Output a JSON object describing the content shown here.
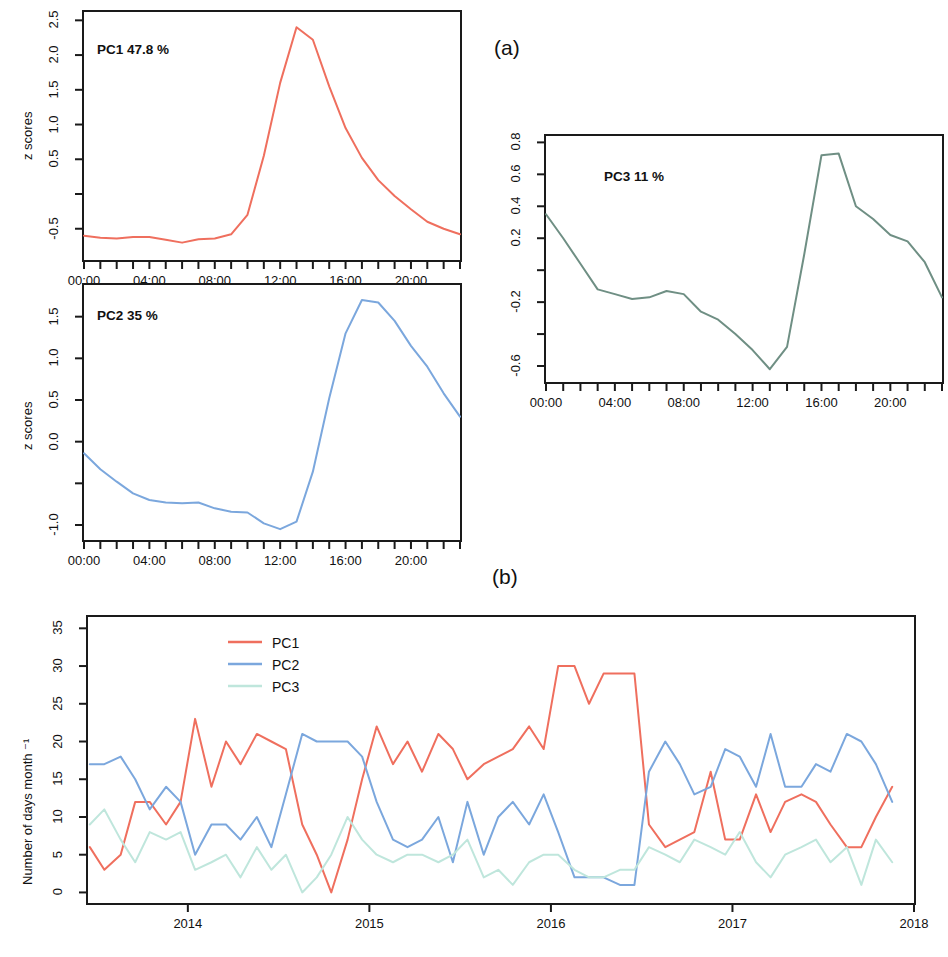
{
  "figure": {
    "panel_a_label": "(a)",
    "panel_b_label": "(b)"
  },
  "chart_data": [
    {
      "id": "pc1",
      "type": "line",
      "title": "PC1 47.8 %",
      "xlabel": "",
      "ylabel": "z scores",
      "xlim": [
        0,
        23
      ],
      "ylim": [
        -0.95,
        2.62
      ],
      "ytick_values": [
        2.5,
        2.0,
        1.5,
        1.0,
        0.5,
        0.0,
        -0.5
      ],
      "ytick_labels": [
        "2.5",
        "2.0",
        "1.5",
        "1.0",
        "0.5",
        "",
        "-0.5"
      ],
      "xtick_values": [
        0,
        1,
        2,
        3,
        4,
        5,
        6,
        7,
        8,
        9,
        10,
        11,
        12,
        13,
        14,
        15,
        16,
        17,
        18,
        19,
        20,
        21,
        22,
        23
      ],
      "xtick_labels": [
        "00:00",
        "",
        "",
        "",
        "04:00",
        "",
        "",
        "",
        "08:00",
        "",
        "",
        "",
        "12:00",
        "",
        "",
        "",
        "16:00",
        "",
        "",
        "",
        "20:00",
        "",
        "",
        ""
      ],
      "grid": false,
      "color": "#ef6f5e",
      "x": [
        0,
        1,
        2,
        3,
        4,
        5,
        6,
        7,
        8,
        9,
        10,
        11,
        12,
        13,
        14,
        15,
        16,
        17,
        18,
        19,
        20,
        21,
        22,
        23
      ],
      "values": [
        -0.6,
        -0.63,
        -0.64,
        -0.62,
        -0.62,
        -0.66,
        -0.7,
        -0.65,
        -0.64,
        -0.58,
        -0.3,
        0.55,
        1.6,
        2.4,
        2.22,
        1.55,
        0.95,
        0.52,
        0.2,
        -0.03,
        -0.22,
        -0.4,
        -0.5,
        -0.58
      ]
    },
    {
      "id": "pc2",
      "type": "line",
      "title": "PC2 35 %",
      "xlabel": "",
      "ylabel": "z scores",
      "xlim": [
        0,
        23
      ],
      "ylim": [
        -1.18,
        1.88
      ],
      "ytick_values": [
        1.5,
        1.0,
        0.5,
        0.0,
        -0.5,
        -1.0
      ],
      "ytick_labels": [
        "1.5",
        "1.0",
        "0.5",
        "0.0",
        "",
        "-1.0"
      ],
      "xtick_values": [
        0,
        1,
        2,
        3,
        4,
        5,
        6,
        7,
        8,
        9,
        10,
        11,
        12,
        13,
        14,
        15,
        16,
        17,
        18,
        19,
        20,
        21,
        22,
        23
      ],
      "xtick_labels": [
        "00:00",
        "",
        "",
        "",
        "04:00",
        "",
        "",
        "",
        "08:00",
        "",
        "",
        "",
        "12:00",
        "",
        "",
        "",
        "16:00",
        "",
        "",
        "",
        "20:00",
        "",
        "",
        ""
      ],
      "grid": false,
      "color": "#7ba7dd",
      "x": [
        0,
        1,
        2,
        3,
        4,
        5,
        6,
        7,
        8,
        9,
        10,
        11,
        12,
        13,
        14,
        15,
        16,
        17,
        18,
        19,
        20,
        21,
        22,
        23
      ],
      "values": [
        -0.14,
        -0.33,
        -0.48,
        -0.62,
        -0.7,
        -0.73,
        -0.74,
        -0.73,
        -0.8,
        -0.84,
        -0.85,
        -0.98,
        -1.05,
        -0.96,
        -0.36,
        0.52,
        1.3,
        1.7,
        1.67,
        1.45,
        1.15,
        0.9,
        0.58,
        0.3
      ]
    },
    {
      "id": "pc3",
      "type": "line",
      "title": "PC3 11 %",
      "xlabel": "",
      "ylabel": "",
      "xlim": [
        0,
        23
      ],
      "ylim": [
        -0.7,
        0.84
      ],
      "ytick_values": [
        0.8,
        0.6,
        0.4,
        0.2,
        0.0,
        -0.2,
        -0.4,
        -0.6
      ],
      "ytick_labels": [
        "0.8",
        "0.6",
        "0.4",
        "0.2",
        "",
        "-0.2",
        "",
        "-0.6"
      ],
      "xtick_values": [
        0,
        1,
        2,
        3,
        4,
        5,
        6,
        7,
        8,
        9,
        10,
        11,
        12,
        13,
        14,
        15,
        16,
        17,
        18,
        19,
        20,
        21,
        22,
        23
      ],
      "xtick_labels": [
        "00:00",
        "",
        "",
        "",
        "04:00",
        "",
        "",
        "",
        "08:00",
        "",
        "",
        "",
        "12:00",
        "",
        "",
        "",
        "16:00",
        "",
        "",
        "",
        "20:00",
        "",
        "",
        ""
      ],
      "grid": false,
      "color": "#6f8f84",
      "x": [
        0,
        1,
        2,
        3,
        4,
        5,
        6,
        7,
        8,
        9,
        10,
        11,
        12,
        13,
        14,
        15,
        16,
        17,
        18,
        19,
        20,
        21,
        22,
        23
      ],
      "values": [
        0.35,
        0.2,
        0.04,
        -0.12,
        -0.15,
        -0.18,
        -0.17,
        -0.13,
        -0.15,
        -0.26,
        -0.31,
        -0.4,
        -0.5,
        -0.62,
        -0.48,
        0.1,
        0.72,
        0.73,
        0.4,
        0.32,
        0.22,
        0.18,
        0.05,
        -0.17
      ]
    },
    {
      "id": "monthly-counts",
      "type": "line",
      "title": "",
      "xlabel": "",
      "ylabel": "Number of days month ⁻¹",
      "xlim": [
        2013.45,
        2018.0
      ],
      "ylim": [
        -1.4,
        36.5
      ],
      "ytick_values": [
        0,
        5,
        10,
        15,
        20,
        25,
        30,
        35
      ],
      "ytick_labels": [
        "0",
        "5",
        "10",
        "15",
        "20",
        "25",
        "30",
        "35"
      ],
      "xtick_values": [
        2014,
        2015,
        2016,
        2017,
        2018
      ],
      "xtick_labels": [
        "2014",
        "2015",
        "2016",
        "2017",
        "2018"
      ],
      "grid": false,
      "legend_position": "top-left-inside",
      "x": [
        2013.46,
        2013.54,
        2013.63,
        2013.71,
        2013.79,
        2013.88,
        2013.96,
        2014.04,
        2014.13,
        2014.21,
        2014.29,
        2014.38,
        2014.46,
        2014.54,
        2014.63,
        2014.71,
        2014.79,
        2014.88,
        2014.96,
        2015.04,
        2015.13,
        2015.21,
        2015.29,
        2015.38,
        2015.46,
        2015.54,
        2015.63,
        2015.71,
        2015.79,
        2015.88,
        2015.96,
        2016.04,
        2016.13,
        2016.21,
        2016.29,
        2016.38,
        2016.46,
        2016.54,
        2016.63,
        2016.71,
        2016.79,
        2016.88,
        2016.96,
        2017.04,
        2017.13,
        2017.21,
        2017.29,
        2017.38,
        2017.46,
        2017.54,
        2017.63,
        2017.71,
        2017.79,
        2017.88
      ],
      "series": [
        {
          "name": "PC1",
          "color": "#ef6f5e",
          "values": [
            6,
            3,
            5,
            12,
            12,
            9,
            12,
            23,
            14,
            20,
            17,
            21,
            20,
            19,
            9,
            5,
            0,
            7,
            15,
            22,
            17,
            20,
            16,
            21,
            19,
            15,
            17,
            18,
            19,
            22,
            19,
            30,
            30,
            25,
            29,
            29,
            29,
            9,
            6,
            7,
            8,
            16,
            7,
            7,
            13,
            8,
            12,
            13,
            12,
            9,
            6,
            6,
            10,
            14
          ]
        },
        {
          "name": "PC2",
          "color": "#7ba7dd",
          "values": [
            17,
            17,
            18,
            15,
            11,
            14,
            12,
            5,
            9,
            9,
            7,
            10,
            6,
            13,
            21,
            20,
            20,
            20,
            18,
            12,
            7,
            6,
            7,
            10,
            4,
            12,
            5,
            10,
            12,
            9,
            13,
            8,
            2,
            2,
            2,
            1,
            1,
            16,
            20,
            17,
            13,
            14,
            19,
            18,
            14,
            21,
            14,
            14,
            17,
            16,
            21,
            20,
            17,
            12
          ]
        },
        {
          "name": "PC3",
          "color": "#bfe6dc",
          "values": [
            9,
            11,
            7,
            4,
            8,
            7,
            8,
            3,
            4,
            5,
            2,
            6,
            3,
            5,
            0,
            2,
            5,
            10,
            7,
            5,
            4,
            5,
            5,
            4,
            5,
            7,
            2,
            3,
            1,
            4,
            5,
            5,
            3,
            2,
            2,
            3,
            3,
            6,
            5,
            4,
            7,
            6,
            5,
            8,
            4,
            2,
            5,
            6,
            7,
            4,
            6,
            1,
            7,
            4
          ]
        }
      ]
    }
  ]
}
